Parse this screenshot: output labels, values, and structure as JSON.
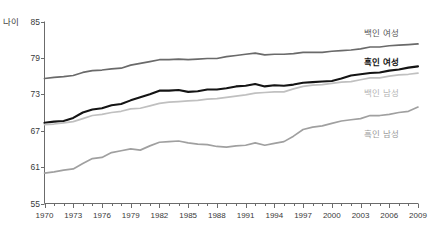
{
  "chart_data": {
    "type": "line",
    "title": "",
    "xlabel": "",
    "ylabel": "나이",
    "ylim": [
      55,
      85
    ],
    "xlim": [
      1970,
      2009
    ],
    "grid": false,
    "legend_position": "right-inline",
    "y_ticks": [
      "85",
      "79",
      "73",
      "67",
      "61",
      "55"
    ],
    "x_ticks": [
      "1970",
      "1973",
      "1976",
      "1979",
      "1982",
      "1985",
      "1988",
      "1991",
      "1994",
      "1997",
      "2000",
      "2003",
      "2006",
      "2009"
    ],
    "x_minor_step": 1,
    "x": [
      1970,
      1971,
      1972,
      1973,
      1974,
      1975,
      1976,
      1977,
      1978,
      1979,
      1980,
      1981,
      1982,
      1983,
      1984,
      1985,
      1986,
      1987,
      1988,
      1989,
      1990,
      1991,
      1992,
      1993,
      1994,
      1995,
      1996,
      1997,
      1998,
      1999,
      2000,
      2001,
      2002,
      2003,
      2004,
      2005,
      2006,
      2007,
      2008,
      2009
    ],
    "series": [
      {
        "name": "백인 여성",
        "color": "#6a6a6a",
        "width": 1.7,
        "label": "백인 여성",
        "values": [
          75.6,
          75.8,
          75.9,
          76.1,
          76.6,
          76.9,
          77.0,
          77.2,
          77.3,
          77.8,
          78.1,
          78.4,
          78.7,
          78.7,
          78.8,
          78.7,
          78.8,
          78.9,
          78.9,
          79.2,
          79.4,
          79.6,
          79.8,
          79.5,
          79.6,
          79.6,
          79.7,
          79.9,
          79.9,
          79.9,
          80.1,
          80.2,
          80.3,
          80.5,
          80.8,
          80.8,
          81.0,
          81.1,
          81.2,
          81.3
        ]
      },
      {
        "name": "흑인 여성",
        "color": "#141414",
        "width": 2.1,
        "label": "흑인 여성",
        "values": [
          68.3,
          68.5,
          68.6,
          69.1,
          70.0,
          70.5,
          70.7,
          71.2,
          71.4,
          72.0,
          72.5,
          73.0,
          73.6,
          73.6,
          73.7,
          73.4,
          73.5,
          73.8,
          73.8,
          74.0,
          74.3,
          74.4,
          74.7,
          74.3,
          74.5,
          74.4,
          74.6,
          74.9,
          75.0,
          75.1,
          75.2,
          75.6,
          76.1,
          76.3,
          76.5,
          76.6,
          76.9,
          77.1,
          77.4,
          77.6
        ]
      },
      {
        "name": "백인 남성",
        "color": "#c0c0c0",
        "width": 1.7,
        "label": "백인 남성",
        "values": [
          68.0,
          68.1,
          68.3,
          68.5,
          69.0,
          69.5,
          69.7,
          70.0,
          70.2,
          70.6,
          70.7,
          71.1,
          71.5,
          71.7,
          71.8,
          71.9,
          72.0,
          72.2,
          72.3,
          72.5,
          72.7,
          72.9,
          73.2,
          73.3,
          73.4,
          73.4,
          73.9,
          74.3,
          74.5,
          74.6,
          74.8,
          75.0,
          75.1,
          75.4,
          75.7,
          75.7,
          76.0,
          76.2,
          76.3,
          76.5
        ]
      },
      {
        "name": "흑인 남성",
        "color": "#a0a0a0",
        "width": 1.7,
        "label": "흑인 남성",
        "values": [
          60.0,
          60.2,
          60.5,
          60.7,
          61.6,
          62.4,
          62.6,
          63.4,
          63.7,
          64.0,
          63.8,
          64.5,
          65.1,
          65.2,
          65.3,
          65.0,
          64.8,
          64.7,
          64.4,
          64.3,
          64.5,
          64.6,
          65.0,
          64.6,
          64.9,
          65.2,
          66.1,
          67.2,
          67.6,
          67.8,
          68.2,
          68.6,
          68.8,
          69.0,
          69.5,
          69.5,
          69.7,
          70.0,
          70.2,
          70.9
        ]
      }
    ]
  },
  "y_axis": {
    "label": "나이",
    "ticks": [
      {
        "value": "85"
      },
      {
        "value": "79"
      },
      {
        "value": "73"
      },
      {
        "value": "67"
      },
      {
        "value": "61"
      },
      {
        "value": "55"
      }
    ]
  },
  "x_axis": {
    "ticks": [
      {
        "value": "1970"
      },
      {
        "value": "1973"
      },
      {
        "value": "1976"
      },
      {
        "value": "1979"
      },
      {
        "value": "1982"
      },
      {
        "value": "1985"
      },
      {
        "value": "1988"
      },
      {
        "value": "1991"
      },
      {
        "value": "1994"
      },
      {
        "value": "1997"
      },
      {
        "value": "2000"
      },
      {
        "value": "2003"
      },
      {
        "value": "2006"
      },
      {
        "value": "2009"
      }
    ]
  },
  "series_labels": {
    "white_women": "백인 여성",
    "black_women": "흑인 여성",
    "white_men": "백인 남성",
    "black_men": "흑인 남성"
  }
}
